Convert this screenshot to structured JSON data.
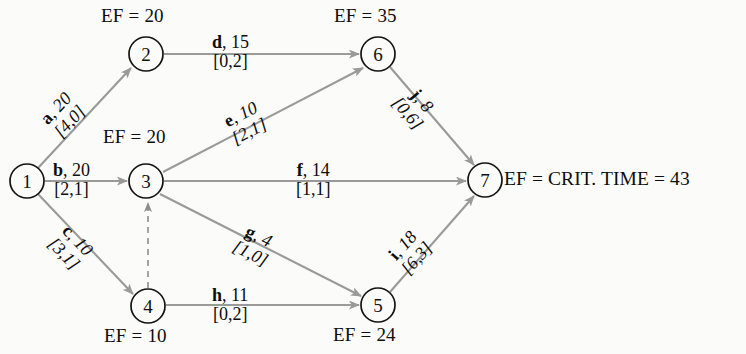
{
  "diagram": {
    "colors": {
      "background": "#fbfbf9",
      "node_stroke": "#141414",
      "edge_stroke": "#9a9a9a",
      "text": "#0d0d0d"
    },
    "nodes": [
      {
        "id": "1",
        "label": "1",
        "cx": 27,
        "cy": 181,
        "r": 17,
        "ef": null,
        "ef_text": ""
      },
      {
        "id": "2",
        "label": "2",
        "cx": 146,
        "cy": 54,
        "r": 17,
        "ef": 20,
        "ef_text": "EF = 20"
      },
      {
        "id": "3",
        "label": "3",
        "cx": 146,
        "cy": 181,
        "r": 17,
        "ef": 20,
        "ef_text": "EF = 20"
      },
      {
        "id": "4",
        "label": "4",
        "cx": 148,
        "cy": 306,
        "r": 17,
        "ef": 10,
        "ef_text": "EF = 10"
      },
      {
        "id": "5",
        "label": "5",
        "cx": 378,
        "cy": 305,
        "r": 17,
        "ef": 24,
        "ef_text": "EF = 24"
      },
      {
        "id": "6",
        "label": "6",
        "cx": 378,
        "cy": 54,
        "r": 17,
        "ef": 35,
        "ef_text": "EF = 35"
      },
      {
        "id": "7",
        "label": "7",
        "cx": 485,
        "cy": 180,
        "r": 17,
        "ef": 43,
        "ef_text": ""
      }
    ],
    "edges": [
      {
        "id": "a",
        "from": "1",
        "to": "2",
        "activity": "a",
        "duration": 20,
        "duration_text": ", 20",
        "float_pair": "[4,0]",
        "style": "solid"
      },
      {
        "id": "b",
        "from": "1",
        "to": "3",
        "activity": "b",
        "duration": 20,
        "duration_text": ", 20",
        "float_pair": "[2,1]",
        "style": "solid"
      },
      {
        "id": "c",
        "from": "1",
        "to": "4",
        "activity": "c",
        "duration": 10,
        "duration_text": ", 10",
        "float_pair": "[3,1]",
        "style": "solid"
      },
      {
        "id": "d",
        "from": "2",
        "to": "6",
        "activity": "d",
        "duration": 15,
        "duration_text": ", 15",
        "float_pair": "[0,2]",
        "style": "solid"
      },
      {
        "id": "e",
        "from": "3",
        "to": "6",
        "activity": "e",
        "duration": 10,
        "duration_text": ", 10",
        "float_pair": "[2,1]",
        "style": "solid"
      },
      {
        "id": "f",
        "from": "3",
        "to": "7",
        "activity": "f",
        "duration": 14,
        "duration_text": ", 14",
        "float_pair": "[1,1]",
        "style": "solid"
      },
      {
        "id": "g",
        "from": "3",
        "to": "5",
        "activity": "g",
        "duration": 4,
        "duration_text": ", 4",
        "float_pair": "[1,0]",
        "style": "solid"
      },
      {
        "id": "h",
        "from": "4",
        "to": "5",
        "activity": "h",
        "duration": 11,
        "duration_text": ", 11",
        "float_pair": "[0,2]",
        "style": "solid"
      },
      {
        "id": "i",
        "from": "5",
        "to": "7",
        "activity": "i",
        "duration": 18,
        "duration_text": ", 18",
        "float_pair": "[6,3]",
        "style": "solid"
      },
      {
        "id": "j",
        "from": "6",
        "to": "7",
        "activity": "j",
        "duration": 8,
        "duration_text": ", 8",
        "float_pair": "[0,6]",
        "style": "solid"
      },
      {
        "id": "dummy",
        "from": "4",
        "to": "3",
        "activity": "",
        "duration": null,
        "duration_text": "",
        "float_pair": "",
        "style": "dashed"
      }
    ],
    "annotations": {
      "critical_time": "EF = CRIT. TIME = 43"
    }
  }
}
